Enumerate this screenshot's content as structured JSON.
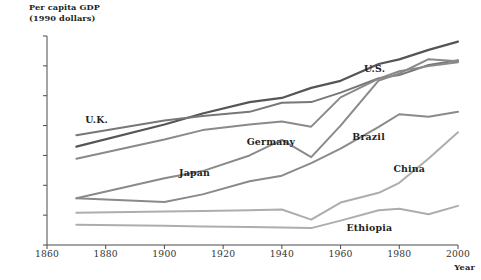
{
  "chart_data": {
    "type": "line",
    "title": "Per capita GDP",
    "subtitle": "(1990 dollars)",
    "xlabel": "Year",
    "ylabel": "Per capita GDP (1990 dollars)",
    "yscale": "log2",
    "ylim": [
      250,
      32000
    ],
    "xlim": [
      1860,
      2000
    ],
    "grid": false,
    "legend_position": "inline-annotations",
    "yticks": [
      250,
      500,
      1000,
      2000,
      4000,
      8000,
      16000,
      32000
    ],
    "ytick_labels": [
      "250",
      "500",
      "1,000",
      "2,000",
      "4,000",
      "8,000",
      "16,000",
      "32,000"
    ],
    "xticks": [
      1860,
      1880,
      1900,
      1920,
      1940,
      1960,
      1980,
      2000
    ],
    "xtick_labels": [
      "1860",
      "1880",
      "1900",
      "1920",
      "1940",
      "1960",
      "1980",
      "2000"
    ],
    "series": [
      {
        "name": "U.S.",
        "color": "#555555",
        "width": 2.2,
        "label_x": 1968,
        "label_y": 15000,
        "x": [
          1870,
          1900,
          1913,
          1929,
          1940,
          1950,
          1960,
          1973,
          1980,
          1990,
          2000
        ],
        "values": [
          2450,
          4100,
          5300,
          6900,
          7600,
          9600,
          11300,
          16700,
          18600,
          23200,
          28100
        ]
      },
      {
        "name": "U.K.",
        "color": "#777777",
        "width": 2.0,
        "label_x": 1873,
        "label_y": 4600,
        "x": [
          1870,
          1900,
          1913,
          1929,
          1940,
          1950,
          1960,
          1973,
          1980,
          1990,
          2000
        ],
        "values": [
          3200,
          4500,
          5000,
          5500,
          6800,
          6900,
          8600,
          12000,
          12900,
          16300,
          18200
        ]
      },
      {
        "name": "Germany",
        "color": "#8a8a8a",
        "width": 2.0,
        "label_x": 1928,
        "label_y": 2750,
        "x": [
          1870,
          1900,
          1913,
          1929,
          1940,
          1950,
          1960,
          1973,
          1980,
          1990,
          2000
        ],
        "values": [
          1850,
          2900,
          3600,
          4100,
          4400,
          3900,
          7700,
          11900,
          14100,
          15900,
          17400
        ]
      },
      {
        "name": "Japan",
        "color": "#8a8a8a",
        "width": 2.0,
        "label_x": 1905,
        "label_y": 1320,
        "x": [
          1870,
          1900,
          1913,
          1929,
          1940,
          1950,
          1960,
          1973,
          1980,
          1990,
          2000
        ],
        "values": [
          740,
          1180,
          1390,
          2000,
          2870,
          1920,
          3990,
          11400,
          13400,
          18700,
          17800
        ]
      },
      {
        "name": "Brazil",
        "color": "#8a8a8a",
        "width": 2.0,
        "label_x": 1964,
        "label_y": 3050,
        "x": [
          1870,
          1900,
          1913,
          1929,
          1940,
          1950,
          1960,
          1973,
          1980,
          1990,
          2000
        ],
        "values": [
          740,
          680,
          810,
          1100,
          1250,
          1670,
          2340,
          3880,
          5200,
          4900,
          5500
        ]
      },
      {
        "name": "China",
        "color": "#adadad",
        "width": 2.0,
        "label_x": 1978,
        "label_y": 1450,
        "x": [
          1870,
          1900,
          1913,
          1929,
          1940,
          1950,
          1960,
          1973,
          1980,
          1990,
          2000
        ],
        "values": [
          530,
          545,
          550,
          560,
          570,
          450,
          670,
          840,
          1060,
          1860,
          3420
        ]
      },
      {
        "name": "Ethiopia",
        "color": "#adadad",
        "width": 2.0,
        "label_x": 1962,
        "label_y": 370,
        "x": [
          1870,
          1900,
          1913,
          1929,
          1940,
          1950,
          1960,
          1973,
          1980,
          1990,
          2000
        ],
        "values": [
          400,
          390,
          385,
          380,
          375,
          370,
          440,
          560,
          580,
          510,
          620
        ]
      }
    ]
  }
}
